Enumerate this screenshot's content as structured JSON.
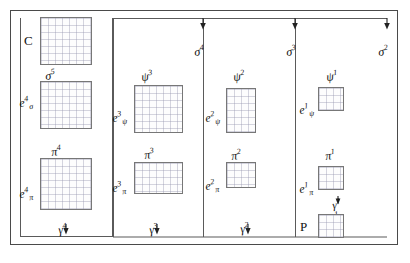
{
  "figure": {
    "corner_labels": {
      "top_left": "C",
      "bottom_right": "P"
    },
    "columns": [
      {
        "name": "column-4",
        "top_arrow_label": null,
        "psi_label": null,
        "grids": [
          {
            "name": "grid-c",
            "label": null
          },
          {
            "name": "grid-e-sigma",
            "label": "e",
            "sub": "σ",
            "sup": "4"
          },
          {
            "name": "grid-e-pi",
            "label": "e",
            "sub": "π",
            "sup": "4"
          }
        ],
        "between_labels": [
          "σ",
          "π"
        ],
        "between_sups": [
          "5",
          "4"
        ],
        "gamma_label": "γ",
        "gamma_sup": "4"
      },
      {
        "name": "column-3",
        "top_arrow_label": "σ",
        "top_arrow_sup": "4",
        "psi_label": "ψ",
        "psi_sup": "3",
        "grids": [
          {
            "name": "grid-e-psi",
            "label": "e",
            "sub": "ψ",
            "sup": "3"
          },
          {
            "name": "grid-e-pi",
            "label": "e",
            "sub": "π",
            "sup": "3"
          }
        ],
        "between_labels": [
          "π"
        ],
        "between_sups": [
          "3"
        ],
        "gamma_label": "γ",
        "gamma_sup": "3"
      },
      {
        "name": "column-2",
        "top_arrow_label": "σ",
        "top_arrow_sup": "3",
        "psi_label": "ψ",
        "psi_sup": "2",
        "grids": [
          {
            "name": "grid-e-psi",
            "label": "e",
            "sub": "ψ",
            "sup": "2"
          },
          {
            "name": "grid-e-pi",
            "label": "e",
            "sub": "π",
            "sup": "2"
          }
        ],
        "between_labels": [
          "π"
        ],
        "between_sups": [
          "2"
        ],
        "gamma_label": "γ",
        "gamma_sup": "2"
      },
      {
        "name": "column-1",
        "top_arrow_label": "σ",
        "top_arrow_sup": "2",
        "psi_label": "ψ",
        "psi_sup": "1",
        "grids": [
          {
            "name": "grid-e-psi",
            "label": "e",
            "sub": "ψ",
            "sup": "1"
          },
          {
            "name": "grid-e-pi",
            "label": "e",
            "sub": "π",
            "sup": "1"
          },
          {
            "name": "grid-p",
            "label": null
          }
        ],
        "between_labels": [
          "π"
        ],
        "between_sups": [
          "1"
        ],
        "gamma_label": "γ",
        "gamma_sup": "1",
        "sigma_label": "σ",
        "sigma_sup": "1"
      }
    ],
    "labels": {
      "c": "C",
      "p": "P",
      "sigma5": "σ",
      "sigma5_sup": "5",
      "sigma4": "σ",
      "sigma4_sup": "4",
      "sigma3": "σ",
      "sigma3_sup": "3",
      "sigma2": "σ",
      "sigma2_sup": "2",
      "sigma1": "σ",
      "sigma1_sup": "1",
      "psi3": "ψ",
      "psi3_sup": "3",
      "psi2": "ψ",
      "psi2_sup": "2",
      "psi1": "ψ",
      "psi1_sup": "1",
      "pi4": "π",
      "pi4_sup": "4",
      "pi3": "π",
      "pi3_sup": "3",
      "pi2": "π",
      "pi2_sup": "2",
      "pi1": "π",
      "pi1_sup": "1",
      "gamma4": "γ",
      "gamma4_sup": "4",
      "gamma3": "γ",
      "gamma3_sup": "3",
      "gamma2": "γ",
      "gamma2_sup": "2",
      "gamma1": "γ",
      "gamma1_sup": "1",
      "e_sigma4": "e",
      "e_sigma4_sub": "σ",
      "e_sigma4_sup": "4",
      "e_pi4": "e",
      "e_pi4_sub": "π",
      "e_pi4_sup": "4",
      "e_psi3": "e",
      "e_psi3_sub": "ψ",
      "e_psi3_sup": "3",
      "e_pi3": "e",
      "e_pi3_sub": "π",
      "e_pi3_sup": "3",
      "e_psi2": "e",
      "e_psi2_sub": "ψ",
      "e_psi2_sup": "2",
      "e_pi2": "e",
      "e_pi2_sub": "π",
      "e_pi2_sup": "2",
      "e_psi1": "e",
      "e_psi1_sub": "ψ",
      "e_psi1_sup": "1",
      "e_pi1": "e",
      "e_pi1_sub": "π",
      "e_pi1_sup": "1"
    },
    "colors": {
      "frame": "#4a4a4a",
      "bracket": "#5a5a5a",
      "grid_border": "#777777",
      "grid_lines": "#9696af",
      "text": "#111111",
      "background": "#ffffff"
    }
  }
}
